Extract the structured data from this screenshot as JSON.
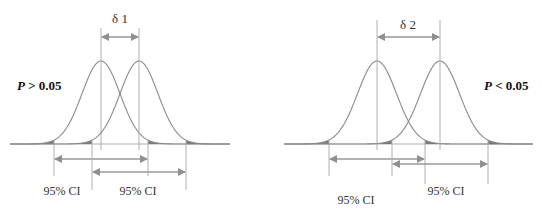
{
  "colors": {
    "curve": "#8a8a8a",
    "shade": "#7a7a7a",
    "arrow": "#999999",
    "line": "#b0b0b0",
    "text": "#333333"
  },
  "left_panel": {
    "delta_label": "δ 1",
    "p_label": "P > 0.05",
    "ci_labels": [
      "95% CI",
      "95% CI"
    ]
  },
  "right_panel": {
    "delta_label": "δ 2",
    "p_label": "P < 0.05",
    "ci_labels": [
      "95% CI",
      "95% CI"
    ]
  }
}
